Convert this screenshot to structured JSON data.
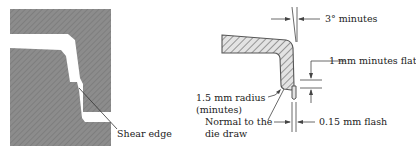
{
  "figure_left": {
    "title": "Shear edge die section",
    "labels": {
      "shear_edge": "Shear edge"
    },
    "colors": {
      "steel": "#8a8a8a",
      "hatch": "#777777",
      "cavity": "#ffffff",
      "leader": "#333333"
    }
  },
  "figure_right": {
    "title": "Molded part edge detail",
    "labels": {
      "draft": "3° minutes",
      "flat": "1 mm minutes flat",
      "radius_line1": "1.5 mm radius",
      "radius_line2": "(minutes)",
      "normal_line1": "Normal to the",
      "normal_line2": "die draw",
      "flash": "0.15 mm flash"
    },
    "colors": {
      "part_fill": "#d9d9d9",
      "part_outline": "#555555",
      "hatch": "#555555",
      "dimension": "#444444"
    }
  }
}
